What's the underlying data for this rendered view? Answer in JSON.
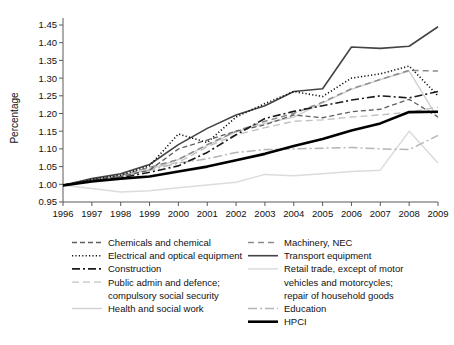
{
  "chart_data": {
    "type": "line",
    "title": "",
    "xlabel": "",
    "ylabel": "Percentage",
    "x": [
      1996,
      1997,
      1998,
      1999,
      2000,
      2001,
      2002,
      2003,
      2004,
      2005,
      2006,
      2007,
      2008,
      2009
    ],
    "xtick_labels": [
      "1996",
      "1997",
      "1998",
      "1999",
      "2000",
      "2001",
      "2002",
      "2003",
      "2004",
      "2005",
      "2006",
      "2007",
      "2008",
      "2009"
    ],
    "ytick_labels": [
      "0.95",
      "1.00",
      "1.05",
      "1.10",
      "1.15",
      "1.20",
      "1.25",
      "1.30",
      "1.35",
      "1.40",
      "1.45"
    ],
    "ylim": [
      0.95,
      1.45
    ],
    "xlim": [
      1996,
      2009
    ],
    "ytick_step": 0.05,
    "grid": false,
    "legend_position": "below-plot-two-columns",
    "series": [
      {
        "name": "Chemicals and chemical",
        "style": "dashed",
        "color": "#5f5f5f",
        "width": 1.3,
        "dash": "5,3",
        "values": [
          0.997,
          1.012,
          1.022,
          1.04,
          1.1,
          1.125,
          1.15,
          1.168,
          1.196,
          1.188,
          1.205,
          1.212,
          1.24,
          1.19
        ]
      },
      {
        "name": "Electrical and optical equipment",
        "style": "dotted",
        "color": "#111111",
        "width": 1.6,
        "dash": "1.2,2.2",
        "values": [
          0.997,
          1.014,
          1.026,
          1.052,
          1.142,
          1.118,
          1.19,
          1.228,
          1.262,
          1.248,
          1.3,
          1.312,
          1.334,
          1.25
        ]
      },
      {
        "name": "Construction",
        "style": "dash-dot",
        "color": "#1a1a1a",
        "width": 1.6,
        "dash": "8,3,2,3",
        "values": [
          0.997,
          1.01,
          1.018,
          1.034,
          1.052,
          1.09,
          1.14,
          1.186,
          1.206,
          1.222,
          1.238,
          1.25,
          1.244,
          1.262
        ]
      },
      {
        "name": "Public admin and defence; compulsory social security",
        "style": "dashed-light",
        "color": "#c2c2c2",
        "width": 1.4,
        "dash": "7,4",
        "values": [
          0.997,
          1.013,
          1.024,
          1.046,
          1.062,
          1.106,
          1.14,
          1.16,
          1.178,
          1.182,
          1.19,
          1.196,
          1.204,
          1.218
        ]
      },
      {
        "name": "Health and social work",
        "style": "solid-light",
        "color": "#d0d0d0",
        "width": 1.4,
        "dash": "",
        "values": [
          0.997,
          1.01,
          1.02,
          1.042,
          1.07,
          1.11,
          1.148,
          1.172,
          1.19,
          1.23,
          1.268,
          1.296,
          1.32,
          1.186
        ]
      },
      {
        "name": "Machinery, NEC",
        "style": "dashed-gray",
        "color": "#8c8c8c",
        "width": 1.5,
        "dash": "6,4",
        "values": [
          0.997,
          1.012,
          1.025,
          1.048,
          1.07,
          1.112,
          1.15,
          1.178,
          1.2,
          1.232,
          1.27,
          1.296,
          1.322,
          1.32
        ]
      },
      {
        "name": "Transport equipment",
        "style": "solid-dark",
        "color": "#444444",
        "width": 1.6,
        "values": [
          0.997,
          1.016,
          1.03,
          1.056,
          1.112,
          1.158,
          1.196,
          1.222,
          1.262,
          1.27,
          1.388,
          1.384,
          1.39,
          1.445
        ]
      },
      {
        "name": "Retail trade, except of motor vehicles and motorcycles; repair of household goods",
        "style": "solid-lighter",
        "color": "#dcdcdc",
        "width": 1.5,
        "values": [
          0.997,
          0.988,
          0.978,
          0.982,
          0.99,
          0.998,
          1.006,
          1.028,
          1.024,
          1.03,
          1.036,
          1.04,
          1.15,
          1.06
        ]
      },
      {
        "name": "Education",
        "style": "dash-dot-light",
        "color": "#b5b5b5",
        "width": 1.5,
        "dash": "9,3,2,3",
        "values": [
          0.997,
          1.012,
          1.022,
          1.04,
          1.06,
          1.072,
          1.09,
          1.098,
          1.1,
          1.102,
          1.104,
          1.1,
          1.098,
          1.138
        ]
      },
      {
        "name": "HPCI",
        "style": "solid-black-thick",
        "color": "#000000",
        "width": 2.6,
        "values": [
          0.997,
          1.008,
          1.016,
          1.022,
          1.036,
          1.05,
          1.068,
          1.086,
          1.108,
          1.128,
          1.152,
          1.172,
          1.204,
          1.205
        ]
      }
    ]
  },
  "legend": {
    "columns": [
      {
        "entries": [
          {
            "label": "Chemicals and chemical",
            "series_index": 0
          },
          {
            "label": "Electrical and optical equipment",
            "series_index": 1
          },
          {
            "label": "Construction",
            "series_index": 2
          },
          {
            "label": "Public admin and defence;",
            "label_line2": "compulsory social security",
            "series_index": 3
          },
          {
            "label": "Health and social work",
            "series_index": 4
          }
        ]
      },
      {
        "entries": [
          {
            "label": "Machinery, NEC",
            "series_index": 5
          },
          {
            "label": "Transport equipment",
            "series_index": 6
          },
          {
            "label": "Retail trade, except of motor",
            "label_line2": "vehicles and motorcycles;",
            "label_line3": "repair of household goods",
            "series_index": 7
          },
          {
            "label": "Education",
            "series_index": 8
          },
          {
            "label": "HPCI",
            "series_index": 9
          }
        ]
      }
    ]
  }
}
